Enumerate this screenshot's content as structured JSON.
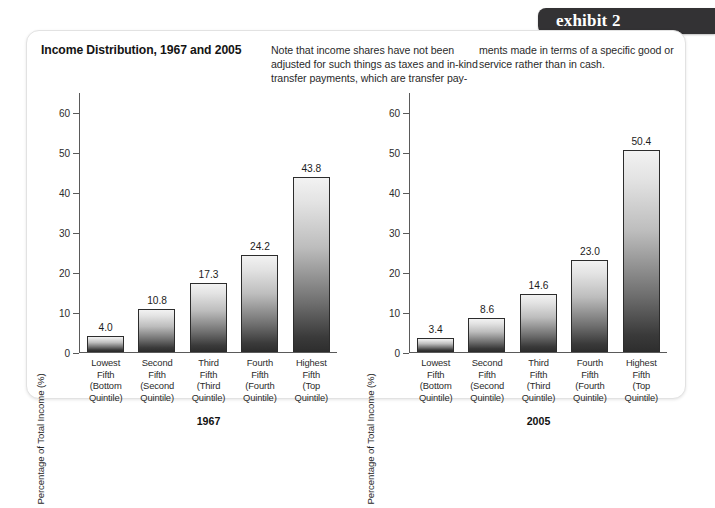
{
  "banner": {
    "label": "exhibit 2"
  },
  "header": {
    "title": "Income Distribution, 1967 and 2005",
    "note_col_1": "Note that income shares have not been adjusted for such things as taxes and in-kind transfer payments, which are transfer pay-",
    "note_col_2": "ments made in terms of a specific good or service rather than in cash."
  },
  "axis": {
    "y_title": "Percentage of Total Income (%)",
    "y_ticks": [
      "0",
      "10",
      "20",
      "30",
      "40",
      "50",
      "60"
    ]
  },
  "categories": [
    "Lowest\nFifth\n(Bottom\nQuintile)",
    "Second\nFifth\n(Second\nQuintile)",
    "Third\nFifth\n(Third\nQuintile)",
    "Fourth\nFifth\n(Fourth\nQuintile)",
    "Highest\nFifth\n(Top\nQuintile)"
  ],
  "chart_data": [
    {
      "type": "bar",
      "title": "1967",
      "xlabel": "",
      "ylabel": "Percentage of Total Income (%)",
      "ylim": [
        0,
        65
      ],
      "grid": false,
      "legend": "none",
      "categories": [
        "Lowest Fifth (Bottom Quintile)",
        "Second Fifth (Second Quintile)",
        "Third Fifth (Third Quintile)",
        "Fourth Fifth (Fourth Quintile)",
        "Highest Fifth (Top Quintile)"
      ],
      "values": [
        4.0,
        10.8,
        17.3,
        24.2,
        43.8
      ],
      "value_labels": [
        "4.0",
        "10.8",
        "17.3",
        "24.2",
        "43.8"
      ],
      "tick_labels": [
        "0",
        "10",
        "20",
        "30",
        "40",
        "50",
        "60"
      ]
    },
    {
      "type": "bar",
      "title": "2005",
      "xlabel": "",
      "ylabel": "Percentage of Total Income (%)",
      "ylim": [
        0,
        65
      ],
      "grid": false,
      "legend": "none",
      "categories": [
        "Lowest Fifth (Bottom Quintile)",
        "Second Fifth (Second Quintile)",
        "Third Fifth (Third Quintile)",
        "Fourth Fifth (Fourth Quintile)",
        "Highest Fifth (Top Quintile)"
      ],
      "values": [
        3.4,
        8.6,
        14.6,
        23.0,
        50.4
      ],
      "value_labels": [
        "3.4",
        "8.6",
        "14.6",
        "23.0",
        "50.4"
      ],
      "tick_labels": [
        "0",
        "10",
        "20",
        "30",
        "40",
        "50",
        "60"
      ]
    }
  ],
  "colors": {
    "banner_bg": "#333234",
    "bar_top": "#f2f2f2",
    "bar_bottom": "#2e2e2e",
    "axis": "#5a5a5a",
    "card_border": "#e2e2e2"
  }
}
